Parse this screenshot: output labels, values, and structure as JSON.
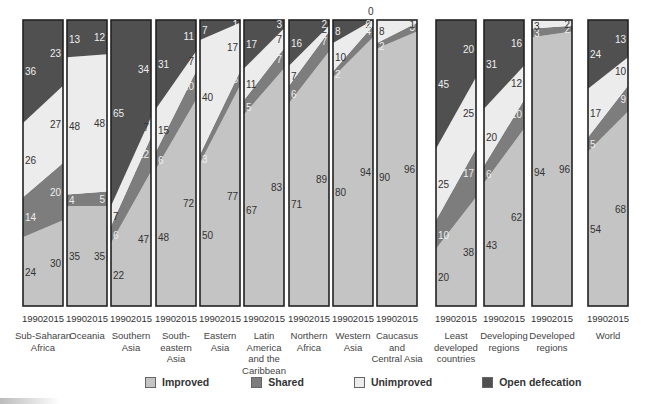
{
  "colors": {
    "improved": "#c4c4c4",
    "shared": "#7d7d7d",
    "unimproved": "#ececec",
    "open_defecation": "#505050",
    "border": "#222222"
  },
  "legend": [
    {
      "key": "improved",
      "label": "Improved"
    },
    {
      "key": "shared",
      "label": "Shared"
    },
    {
      "key": "unimproved",
      "label": "Unimproved"
    },
    {
      "key": "open_defecation",
      "label": "Open defecation"
    }
  ],
  "chart_data": {
    "type": "bar",
    "subtype": "stacked-100-percent-slope",
    "title": "",
    "xlabel": "",
    "ylabel": "",
    "ylim": [
      0,
      100
    ],
    "years": [
      "1990",
      "2015"
    ],
    "series_order": [
      "Improved",
      "Shared",
      "Unimproved",
      "Open defecation"
    ],
    "categories": [
      "Sub-Saharan Africa",
      "Oceania",
      "Southern Asia",
      "South-eastern Asia",
      "Eastern Asia",
      "Latin America and the Caribbean",
      "Northern Africa",
      "Western Asia",
      "Caucasus and Central Asia",
      "Least developed countries",
      "Developing regions",
      "Developed regions",
      "World"
    ],
    "series": [
      {
        "name": "Improved",
        "values_1990": [
          24,
          35,
          22,
          48,
          50,
          67,
          71,
          80,
          90,
          20,
          43,
          94,
          54
        ],
        "values_2015": [
          30,
          35,
          47,
          72,
          77,
          83,
          89,
          94,
          96,
          38,
          62,
          96,
          68
        ]
      },
      {
        "name": "Shared",
        "values_1990": [
          14,
          4,
          6,
          6,
          3,
          5,
          6,
          2,
          2,
          10,
          6,
          3,
          5
        ],
        "values_2015": [
          20,
          5,
          12,
          10,
          5,
          7,
          7,
          4,
          3,
          17,
          10,
          2,
          9
        ]
      },
      {
        "name": "Unimproved",
        "values_1990": [
          26,
          48,
          7,
          15,
          40,
          11,
          7,
          10,
          8,
          25,
          20,
          3,
          17
        ],
        "values_2015": [
          27,
          48,
          7,
          7,
          17,
          7,
          2,
          2,
          1,
          25,
          12,
          2,
          10
        ]
      },
      {
        "name": "Open defecation",
        "values_1990": [
          36,
          13,
          65,
          31,
          7,
          17,
          16,
          8,
          0,
          45,
          31,
          0,
          24
        ],
        "values_2015": [
          23,
          12,
          34,
          11,
          1,
          3,
          2,
          0,
          0,
          20,
          16,
          0,
          13
        ]
      }
    ]
  },
  "panels": [
    {
      "name": "Sub-Saharan Africa",
      "lines": [
        "Sub-Saharan",
        "Africa"
      ],
      "x": 23,
      "v1990": [
        24,
        14,
        26,
        36
      ],
      "v2015": [
        30,
        20,
        27,
        23
      ],
      "labels": [
        [
          "24",
          "30"
        ],
        [
          "14",
          "20"
        ],
        [
          "26",
          "27"
        ],
        [
          "36",
          "23"
        ]
      ]
    },
    {
      "name": "Oceania",
      "lines": [
        "Oceania"
      ],
      "x": 67,
      "v1990": [
        35,
        4,
        48,
        13
      ],
      "v2015": [
        35,
        5,
        48,
        12
      ],
      "labels": [
        [
          "35",
          "35"
        ],
        [
          "4",
          "5"
        ],
        [
          "48",
          "48"
        ],
        [
          "13",
          "12"
        ]
      ]
    },
    {
      "name": "Southern Asia",
      "lines": [
        "Southern",
        "Asia"
      ],
      "x": 111,
      "v1990": [
        22,
        6,
        7,
        65
      ],
      "v2015": [
        47,
        12,
        7,
        34
      ],
      "labels": [
        [
          "22",
          "47"
        ],
        [
          "6",
          "12"
        ],
        [
          "7",
          "7"
        ],
        [
          "65",
          "34"
        ]
      ]
    },
    {
      "name": "South-eastern Asia",
      "lines": [
        "South-",
        "eastern",
        "Asia"
      ],
      "x": 156,
      "v1990": [
        48,
        6,
        15,
        31
      ],
      "v2015": [
        72,
        10,
        7,
        11
      ],
      "labels": [
        [
          "48",
          "72"
        ],
        [
          "6",
          "10"
        ],
        [
          "15",
          "7"
        ],
        [
          "31",
          "11"
        ]
      ]
    },
    {
      "name": "Eastern Asia",
      "lines": [
        "Eastern",
        "Asia"
      ],
      "x": 200,
      "v1990": [
        50,
        3,
        40,
        7
      ],
      "v2015": [
        77,
        5,
        17,
        1
      ],
      "labels": [
        [
          "50",
          "77"
        ],
        [
          "3",
          "5"
        ],
        [
          "40",
          "17"
        ],
        [
          "7",
          "1"
        ]
      ]
    },
    {
      "name": "Latin America and the Caribbean",
      "lines": [
        "Latin",
        "America",
        "and the",
        "Caribbean"
      ],
      "x": 244,
      "v1990": [
        67,
        5,
        11,
        17
      ],
      "v2015": [
        83,
        7,
        7,
        3
      ],
      "labels": [
        [
          "67",
          "83"
        ],
        [
          "5",
          "7"
        ],
        [
          "11",
          "7"
        ],
        [
          "17",
          "3"
        ]
      ]
    },
    {
      "name": "Northern Africa",
      "lines": [
        "Northern",
        "Africa"
      ],
      "x": 289,
      "v1990": [
        71,
        6,
        7,
        16
      ],
      "v2015": [
        89,
        7,
        2,
        2
      ],
      "labels": [
        [
          "71",
          "89"
        ],
        [
          "6",
          "7"
        ],
        [
          "7",
          "2"
        ],
        [
          "16",
          "2"
        ]
      ]
    },
    {
      "name": "Western Asia",
      "lines": [
        "Western",
        "Asia"
      ],
      "x": 333,
      "v1990": [
        80,
        2,
        10,
        8
      ],
      "v2015": [
        94,
        4,
        2,
        0
      ],
      "labels": [
        [
          "80",
          "94"
        ],
        [
          "2",
          "4"
        ],
        [
          "10",
          "2"
        ],
        [
          "8",
          "0"
        ]
      ]
    },
    {
      "name": "Caucasus and Central Asia",
      "lines": [
        "Caucasus",
        "and",
        "Central Asia"
      ],
      "x": 377,
      "v1990": [
        90,
        2,
        8,
        0
      ],
      "v2015": [
        96,
        3,
        1,
        0
      ],
      "labels": [
        [
          "90",
          "96"
        ],
        [
          "2",
          "3"
        ],
        [
          "8",
          "1"
        ],
        [
          "",
          ""
        ]
      ]
    },
    {
      "name": "Least developed countries",
      "lines": [
        "Least",
        "developed",
        "countries"
      ],
      "x": 436,
      "v1990": [
        20,
        10,
        25,
        45
      ],
      "v2015": [
        38,
        17,
        25,
        20
      ],
      "labels": [
        [
          "20",
          "38"
        ],
        [
          "10",
          "17"
        ],
        [
          "25",
          "25"
        ],
        [
          "45",
          "20"
        ]
      ]
    },
    {
      "name": "Developing regions",
      "lines": [
        "Developing",
        "regions"
      ],
      "x": 484,
      "v1990": [
        43,
        6,
        20,
        31
      ],
      "v2015": [
        62,
        10,
        12,
        16
      ],
      "labels": [
        [
          "43",
          "62"
        ],
        [
          "6",
          "10"
        ],
        [
          "20",
          "12"
        ],
        [
          "31",
          "16"
        ]
      ]
    },
    {
      "name": "Developed regions",
      "lines": [
        "Developed",
        "regions"
      ],
      "x": 532,
      "v1990": [
        94,
        3,
        3,
        0
      ],
      "v2015": [
        96,
        2,
        2,
        0
      ],
      "labels": [
        [
          "94",
          "96"
        ],
        [
          "3",
          "2"
        ],
        [
          "3",
          "2"
        ],
        [
          "",
          ""
        ]
      ]
    },
    {
      "name": "World",
      "lines": [
        "World"
      ],
      "x": 588,
      "v1990": [
        54,
        5,
        17,
        24
      ],
      "v2015": [
        68,
        9,
        10,
        13
      ],
      "labels": [
        [
          "54",
          "68"
        ],
        [
          "5",
          "9"
        ],
        [
          "17",
          "10"
        ],
        [
          "24",
          "13"
        ]
      ]
    }
  ]
}
